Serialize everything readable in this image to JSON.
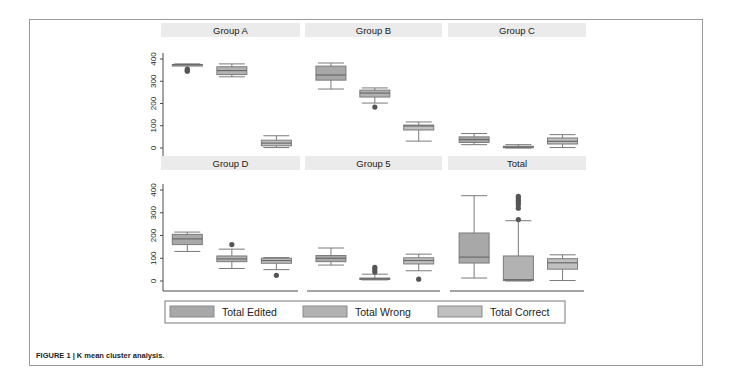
{
  "figure": {
    "caption": "FIGURE 1 | K mean cluster analysis."
  },
  "colors": {
    "box_fill_edited": "#a8a8a8",
    "box_fill_wrong": "#b2b2b2",
    "box_fill_correct": "#c0c0c0",
    "box_stroke": "#7a7a7a",
    "axis": "#4a4a4a",
    "title_band": "#ebebeb",
    "outlier": "#555555"
  },
  "chart_data": {
    "type": "boxplot",
    "title": "K mean cluster analysis",
    "ylim": [
      0,
      400
    ],
    "yticks": [
      0,
      100,
      200,
      300,
      400
    ],
    "legend": {
      "position": "bottom",
      "entries": [
        "Total Edited",
        "Total Wrong",
        "Total Correct"
      ]
    },
    "series_names": [
      "Total Edited",
      "Total Wrong",
      "Total Correct"
    ],
    "panels": [
      {
        "title": "Group A",
        "boxes": [
          {
            "series": "Total Edited",
            "min": 375,
            "q1": 375,
            "median": 375,
            "q3": 375,
            "max": 378,
            "outliers": [
              345,
              350,
              355
            ]
          },
          {
            "series": "Total Wrong",
            "min": 320,
            "q1": 330,
            "median": 348,
            "q3": 365,
            "max": 378,
            "outliers": []
          },
          {
            "series": "Total Correct",
            "min": 2,
            "q1": 10,
            "median": 22,
            "q3": 35,
            "max": 55,
            "outliers": []
          }
        ]
      },
      {
        "title": "Group B",
        "boxes": [
          {
            "series": "Total Edited",
            "min": 265,
            "q1": 305,
            "median": 328,
            "q3": 368,
            "max": 382,
            "outliers": []
          },
          {
            "series": "Total Wrong",
            "min": 202,
            "q1": 229,
            "median": 247,
            "q3": 260,
            "max": 270,
            "outliers": [
              184
            ]
          },
          {
            "series": "Total Correct",
            "min": 31,
            "q1": 81,
            "median": 99,
            "q3": 103,
            "max": 117,
            "outliers": []
          }
        ]
      },
      {
        "title": "Group C",
        "boxes": [
          {
            "series": "Total Edited",
            "min": 15,
            "q1": 25,
            "median": 38,
            "q3": 50,
            "max": 65,
            "outliers": []
          },
          {
            "series": "Total Wrong",
            "min": 0,
            "q1": 2,
            "median": 4,
            "q3": 8,
            "max": 15,
            "outliers": []
          },
          {
            "series": "Total Correct",
            "min": 2,
            "q1": 18,
            "median": 30,
            "q3": 45,
            "max": 60,
            "outliers": []
          }
        ]
      },
      {
        "title": "Group D",
        "boxes": [
          {
            "series": "Total Edited",
            "min": 130,
            "q1": 160,
            "median": 185,
            "q3": 205,
            "max": 215,
            "outliers": []
          },
          {
            "series": "Total Wrong",
            "min": 55,
            "q1": 85,
            "median": 97,
            "q3": 110,
            "max": 140,
            "outliers": [
              160
            ]
          },
          {
            "series": "Total Correct",
            "min": 50,
            "q1": 78,
            "median": 90,
            "q3": 100,
            "max": 103,
            "outliers": [
              25
            ]
          }
        ]
      },
      {
        "title": "Group 5",
        "boxes": [
          {
            "series": "Total Edited",
            "min": 70,
            "q1": 85,
            "median": 100,
            "q3": 112,
            "max": 145,
            "outliers": []
          },
          {
            "series": "Total Wrong",
            "min": 5,
            "q1": 8,
            "median": 10,
            "q3": 13,
            "max": 30,
            "outliers": [
              40,
              50,
              60
            ]
          },
          {
            "series": "Total Correct",
            "min": 45,
            "q1": 75,
            "median": 90,
            "q3": 102,
            "max": 118,
            "outliers": [
              8
            ]
          }
        ]
      },
      {
        "title": "Total",
        "boxes": [
          {
            "series": "Total Edited",
            "min": 13,
            "q1": 79,
            "median": 105,
            "q3": 211,
            "max": 375,
            "outliers": []
          },
          {
            "series": "Total Wrong",
            "min": 0,
            "q1": 2,
            "median": 6,
            "q3": 110,
            "max": 265,
            "outliers": [
              270,
              320,
              335,
              345,
              355,
              365,
              372
            ]
          },
          {
            "series": "Total Correct",
            "min": 2,
            "q1": 52,
            "median": 80,
            "q3": 98,
            "max": 115,
            "outliers": []
          }
        ]
      }
    ]
  }
}
